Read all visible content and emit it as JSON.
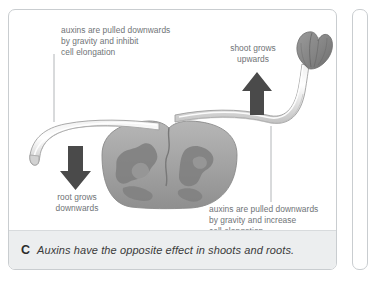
{
  "figure": {
    "caption_letter": "C",
    "caption_text": "Auxins have the opposite effect in shoots and roots."
  },
  "labels": {
    "top_left": "auxins are pulled downwards\nby gravity and inhibit\ncell elongation",
    "top_right": "shoot grows\nupwards",
    "bottom_left": "root grows\ndownwards",
    "bottom_right": "auxins are pulled downwards\nby gravity and increase\ncell elongation"
  },
  "icons": {
    "down_arrow": "arrow-down-icon",
    "up_arrow": "arrow-up-icon"
  },
  "artwork": {
    "seed_name": "germinating-seed",
    "shoot_name": "shoot",
    "shoot_tip_name": "shoot-tip",
    "root_name": "root",
    "root_tip_name": "root-tip"
  },
  "colors": {
    "panel_border": "#c9cdd0",
    "label_text": "#6f7376",
    "caption_bg": "#eceeef",
    "caption_text": "#3a3a3a",
    "arrow_fill": "#4a4a4a",
    "seed_fill": "#a8a8a8",
    "seed_mottle": "#7e7e7e",
    "tip_fill": "#8d8d8d",
    "leader_line": "#a9adb0"
  }
}
